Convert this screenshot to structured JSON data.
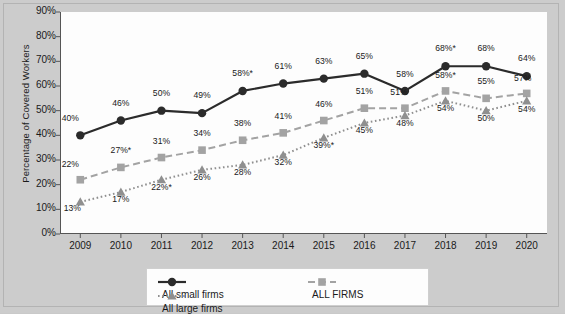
{
  "chart_data": {
    "type": "line",
    "title": "",
    "xlabel": "",
    "ylabel": "Percentage of Covered Workers",
    "ylim": [
      0,
      90
    ],
    "grid": false,
    "legend_position": "bottom",
    "categories": [
      "2009",
      "2010",
      "2011",
      "2012",
      "2013",
      "2014",
      "2015",
      "2016",
      "2017",
      "2018",
      "2019",
      "2020"
    ],
    "ytick_labels": [
      "90%",
      "80%",
      "70%",
      "60%",
      "50%",
      "40%",
      "30%",
      "20%",
      "10%",
      "0%"
    ],
    "ytick_values": [
      90,
      80,
      70,
      60,
      50,
      40,
      30,
      20,
      10,
      0
    ],
    "series": [
      {
        "name": "All small firms",
        "marker": "circle",
        "linestyle": "solid",
        "color": "#2b2b2b",
        "values": [
          40,
          46,
          50,
          49,
          58,
          61,
          63,
          65,
          58,
          68,
          68,
          64
        ],
        "labels": [
          "40%",
          "46%",
          "50%",
          "49%",
          "58%*",
          "61%",
          "63%",
          "65%",
          "58%",
          "68%*",
          "68%",
          "64%"
        ]
      },
      {
        "name": "ALL FIRMS",
        "marker": "square",
        "linestyle": "dashed",
        "color": "#a3a3a3",
        "values": [
          22,
          27,
          31,
          34,
          38,
          41,
          46,
          51,
          51,
          58,
          55,
          57
        ],
        "labels": [
          "22%",
          "27%*",
          "31%",
          "34%",
          "38%",
          "41%",
          "46%",
          "51%",
          "51%",
          "58%*",
          "55%",
          "57%"
        ]
      },
      {
        "name": "All large firms",
        "marker": "triangle",
        "linestyle": "dotted",
        "color": "#8f8f8f",
        "values": [
          13,
          17,
          22,
          26,
          28,
          32,
          39,
          45,
          48,
          54,
          50,
          54
        ],
        "labels": [
          "13%",
          "17%",
          "22%*",
          "26%",
          "28%",
          "32%",
          "39%*",
          "45%",
          "48%",
          "54%",
          "50%",
          "54%"
        ]
      }
    ]
  },
  "legend": {
    "items": [
      {
        "label": "All small firms"
      },
      {
        "label": "ALL FIRMS"
      },
      {
        "label": "All large firms"
      }
    ]
  }
}
